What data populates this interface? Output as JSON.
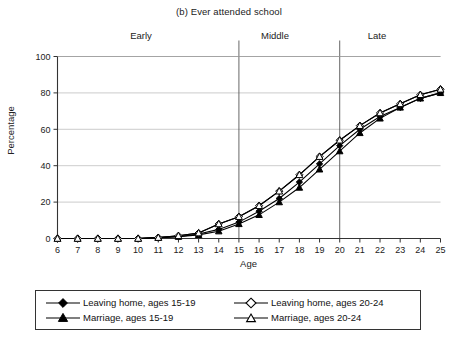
{
  "chart_data": {
    "type": "line",
    "title": "(b) Ever attended school",
    "xlabel": "Age",
    "ylabel": "Percentage",
    "xlim": [
      6,
      25
    ],
    "ylim": [
      0,
      100
    ],
    "yticks": [
      0,
      20,
      40,
      60,
      80,
      100
    ],
    "xticks": [
      6,
      7,
      8,
      9,
      10,
      11,
      12,
      13,
      14,
      15,
      16,
      17,
      18,
      19,
      20,
      21,
      22,
      23,
      24,
      25
    ],
    "grid": "horizontal",
    "legend_position": "below-plot",
    "x": [
      6,
      7,
      8,
      9,
      10,
      11,
      12,
      13,
      14,
      15,
      16,
      17,
      18,
      19,
      20,
      21,
      22,
      23,
      24,
      25
    ],
    "series": [
      {
        "name": "Leaving home, ages 15-19",
        "marker": "filled-diamond",
        "values": [
          0,
          0,
          0,
          0,
          0,
          0.5,
          1,
          2.5,
          5,
          9,
          15,
          22,
          31,
          41,
          51,
          60,
          67,
          72,
          77,
          80
        ]
      },
      {
        "name": "Marriage, ages 15-19",
        "marker": "filled-triangle",
        "values": [
          0,
          0,
          0,
          0,
          0,
          0.5,
          1,
          2,
          4,
          8,
          13,
          20,
          28,
          38,
          48,
          58,
          66,
          72,
          77,
          80
        ]
      },
      {
        "name": "Leaving home, ages 20-24",
        "marker": "open-diamond",
        "values": [
          0,
          0,
          0,
          0,
          0,
          0.5,
          1.5,
          3,
          8,
          12,
          18,
          26,
          35,
          45,
          54,
          62,
          69,
          74,
          79,
          82
        ]
      },
      {
        "name": "Marriage, ages 20-24",
        "marker": "open-triangle",
        "values": [
          0,
          0,
          0,
          0,
          0,
          0.5,
          1.5,
          3,
          8,
          12,
          18,
          26,
          35,
          45,
          54,
          62,
          69,
          74,
          79,
          82
        ]
      }
    ],
    "annotations": [
      {
        "label": "Early",
        "type": "phase-label"
      },
      {
        "label": "Middle",
        "type": "phase-label"
      },
      {
        "label": "Late",
        "type": "phase-label"
      }
    ],
    "vertical_dividers": [
      15,
      20
    ],
    "colors": {
      "line": "#000000",
      "grid": "#bfbfbf",
      "axis": "#333333",
      "background": "#ffffff"
    }
  },
  "legend": {
    "entries": [
      {
        "label": "Leaving home, ages 15-19",
        "marker": "filled-diamond"
      },
      {
        "label": "Marriage, ages 15-19",
        "marker": "filled-triangle"
      },
      {
        "label": "Leaving home, ages 20-24",
        "marker": "open-diamond"
      },
      {
        "label": "Marriage, ages 20-24",
        "marker": "open-triangle"
      }
    ]
  }
}
